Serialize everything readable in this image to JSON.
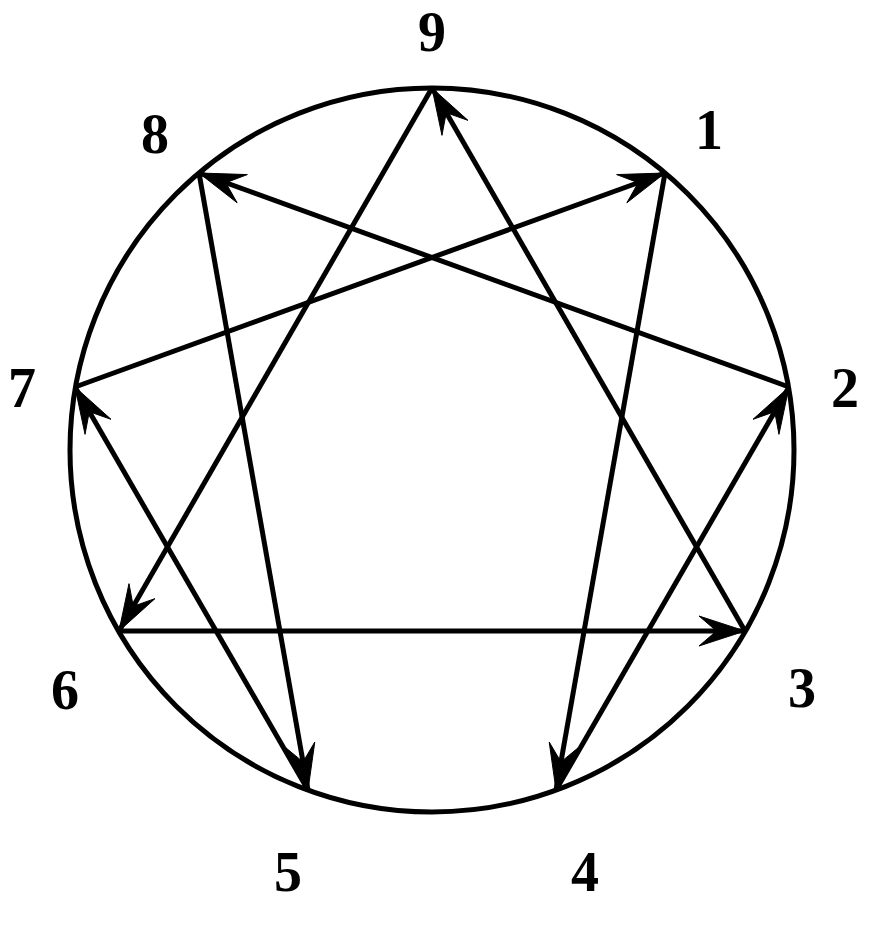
{
  "figure": {
    "name": "Enneagram",
    "background_color": "#ffffff",
    "stroke_color": "#000000",
    "label_color": "#000000"
  },
  "circle": {
    "name": "enneagram-circle",
    "center_x": 432,
    "center_y": 450,
    "radius": 362,
    "stroke_width": 5
  },
  "points": [
    {
      "id": "9",
      "label": "9",
      "angle_deg": 90,
      "x": 432,
      "y": 88,
      "label_x": 432,
      "label_y": 32
    },
    {
      "id": "1",
      "label": "1",
      "angle_deg": 50,
      "x": 665,
      "y": 173,
      "label_x": 709,
      "label_y": 130
    },
    {
      "id": "2",
      "label": "2",
      "angle_deg": 10,
      "x": 789,
      "y": 387,
      "label_x": 845,
      "label_y": 388
    },
    {
      "id": "3",
      "label": "3",
      "angle_deg": -30,
      "x": 745,
      "y": 631,
      "label_x": 802,
      "label_y": 688
    },
    {
      "id": "4",
      "label": "4",
      "angle_deg": -70,
      "x": 556,
      "y": 790,
      "label_x": 585,
      "label_y": 872
    },
    {
      "id": "5",
      "label": "5",
      "angle_deg": -110,
      "x": 308,
      "y": 790,
      "label_x": 288,
      "label_y": 872
    },
    {
      "id": "6",
      "label": "6",
      "angle_deg": -150,
      "x": 119,
      "y": 631,
      "label_x": 65,
      "label_y": 690
    },
    {
      "id": "7",
      "label": "7",
      "angle_deg": 170,
      "x": 75,
      "y": 387,
      "label_x": 22,
      "label_y": 388
    },
    {
      "id": "8",
      "label": "8",
      "angle_deg": 130,
      "x": 199,
      "y": 173,
      "label_x": 155,
      "label_y": 134
    }
  ],
  "chart_data": {
    "type": "diagram",
    "shape": "nine-pointed figure inscribed in a circle",
    "node_labels": [
      "1",
      "2",
      "3",
      "4",
      "5",
      "6",
      "7",
      "8",
      "9"
    ],
    "triangle_sequence": [
      "9",
      "6",
      "3",
      "9"
    ],
    "hexad_sequence": [
      "1",
      "4",
      "2",
      "8",
      "5",
      "7",
      "1"
    ],
    "arrows": [
      {
        "name": "arrow-9-to-6",
        "from": "9",
        "to": "6",
        "directed": true,
        "group": "triangle"
      },
      {
        "name": "arrow-6-to-3",
        "from": "6",
        "to": "3",
        "directed": true,
        "group": "triangle"
      },
      {
        "name": "arrow-3-to-9",
        "from": "3",
        "to": "9",
        "directed": true,
        "group": "triangle"
      },
      {
        "name": "arrow-1-to-4",
        "from": "1",
        "to": "4",
        "directed": true,
        "group": "hexad"
      },
      {
        "name": "arrow-4-to-2",
        "from": "4",
        "to": "2",
        "directed": true,
        "group": "hexad"
      },
      {
        "name": "arrow-2-to-8",
        "from": "2",
        "to": "8",
        "directed": true,
        "group": "hexad"
      },
      {
        "name": "arrow-8-to-5",
        "from": "8",
        "to": "5",
        "directed": true,
        "group": "hexad"
      },
      {
        "name": "arrow-5-to-7",
        "from": "5",
        "to": "7",
        "directed": true,
        "group": "hexad"
      },
      {
        "name": "arrow-7-to-1",
        "from": "7",
        "to": "1",
        "directed": true,
        "group": "hexad"
      }
    ],
    "line_stroke_width": 5,
    "arrowhead_length": 46,
    "arrowhead_half_width": 15
  }
}
